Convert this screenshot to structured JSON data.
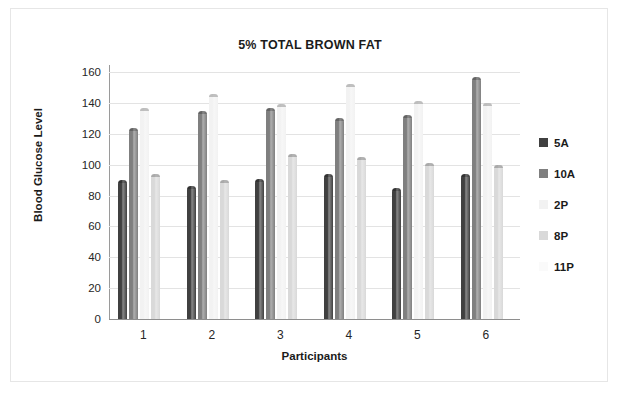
{
  "chart_data": {
    "type": "bar",
    "title": "5% TOTAL BROWN FAT",
    "xlabel": "Participants",
    "ylabel": "Blood Glucose Level",
    "categories": [
      "1",
      "2",
      "3",
      "4",
      "5",
      "6"
    ],
    "ylim": [
      0,
      160
    ],
    "yticks": [
      0,
      20,
      40,
      60,
      80,
      100,
      120,
      140,
      160
    ],
    "grid": true,
    "legend_position": "right",
    "series": [
      {
        "name": "5A",
        "color": "#404040",
        "values": [
          90,
          86,
          91,
          94,
          85,
          94
        ]
      },
      {
        "name": "10A",
        "color": "#7f7f7f",
        "values": [
          124,
          135,
          137,
          130,
          132,
          157
        ]
      },
      {
        "name": "2P",
        "color": "#f2f2f2",
        "values": [
          137,
          146,
          139,
          152,
          141,
          140
        ]
      },
      {
        "name": "8P",
        "color": "#d9d9d9",
        "values": [
          94,
          90,
          107,
          105,
          101,
          100
        ]
      },
      {
        "name": "11P",
        "color": "#fafafa",
        "values": [
          0,
          0,
          0,
          0,
          0,
          0
        ]
      }
    ]
  }
}
